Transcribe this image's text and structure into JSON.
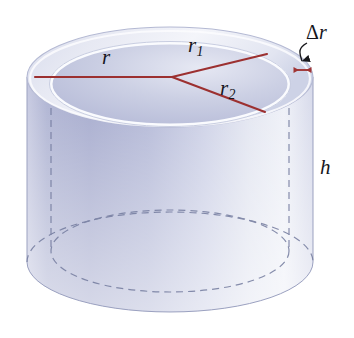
{
  "figure": {
    "name": "cylindrical-shell-diagram",
    "background_color": "#ffffff"
  },
  "labels": {
    "average_radius": "r",
    "inner_radius_base": "r",
    "inner_radius_sub": "1",
    "outer_radius_base": "r",
    "outer_radius_sub": "2",
    "height": "h",
    "thickness_delta": "Δ",
    "thickness_radius": "r"
  },
  "colors": {
    "radius_line": "#9c3030",
    "thickness_arrow": "#a03535",
    "pointer_arrow": "#1a1a1a",
    "shell_light": "#eef0f7",
    "shell_mid": "#c4c8e0",
    "shell_dark": "#a3a8cd",
    "top_band": "#f2f3f9",
    "hidden_edge": "#7f86a6",
    "label_text": "#16161c"
  },
  "geometry": {
    "outer_ellipse_top": {
      "cx": 170,
      "cy": 77,
      "rx": 143,
      "ry": 50
    },
    "inner_ellipse_top": {
      "cx": 170,
      "cy": 84,
      "rx": 119,
      "ry": 41
    },
    "outer_ellipse_bottom": {
      "cx": 170,
      "cy": 262,
      "rx": 143,
      "ry": 50
    },
    "inner_ellipse_bottom": {
      "cx": 170,
      "cy": 251,
      "rx": 119,
      "ry": 41
    },
    "cylinder_height_px": 185,
    "center_point": {
      "x": 172,
      "y": 77
    },
    "r_line_end": {
      "x": 35,
      "y": 77
    },
    "r1_line_end": {
      "x": 267,
      "y": 54
    },
    "r2_line_end": {
      "x": 265,
      "y": 112
    },
    "thickness_arrow": {
      "x1": 292,
      "x2": 313,
      "y": 70
    }
  }
}
